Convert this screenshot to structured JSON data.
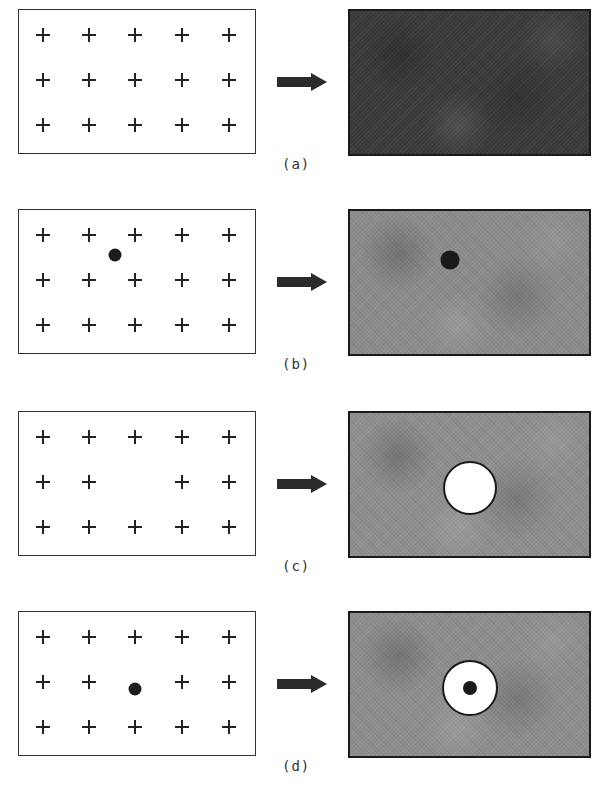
{
  "figure": {
    "grid": {
      "rows": 3,
      "cols": 5
    },
    "colors": {
      "cross": "#222222",
      "arrow": "#2b2b2b",
      "border": "#1a1a1a"
    },
    "panels": [
      {
        "id": "a",
        "label": "(a)",
        "top": 9,
        "missing_sites": [],
        "defect_dot": null,
        "result_fill": "#3a3a3a",
        "result_hole": null,
        "result_dot": null
      },
      {
        "id": "b",
        "label": "(b)",
        "top": 209,
        "missing_sites": [],
        "defect_dot": {
          "x": 96,
          "y": 45
        },
        "result_fill": "#8c8c8c",
        "result_hole": null,
        "result_dot": {
          "x": 100,
          "y": 49,
          "d": 19
        }
      },
      {
        "id": "c",
        "label": "(c)",
        "top": 411,
        "missing_sites": [
          [
            1,
            2
          ]
        ],
        "defect_dot": null,
        "result_fill": "#8f8f8f",
        "result_hole": {
          "x": 120,
          "y": 75,
          "d": 54
        },
        "result_dot": null
      },
      {
        "id": "d",
        "label": "(d)",
        "top": 611,
        "missing_sites": [
          [
            1,
            2
          ]
        ],
        "defect_dot": {
          "x": 116,
          "y": 77
        },
        "result_fill": "#8e8e8e",
        "result_hole": {
          "x": 120,
          "y": 75,
          "d": 56
        },
        "result_dot": {
          "x": 120,
          "y": 75,
          "d": 14
        }
      }
    ]
  }
}
